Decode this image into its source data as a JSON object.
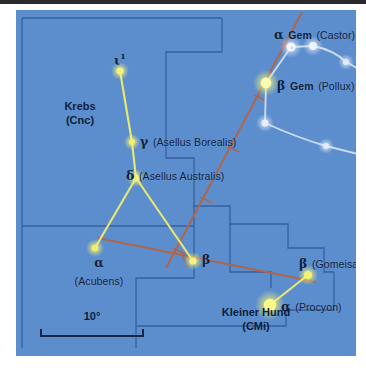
{
  "figure": {
    "type": "star-chart",
    "background_color": "#5c8ece",
    "star_color": "#f2f06a",
    "bright_star_color": "#fbfb8a",
    "constellation_line_color": "#e8e86e",
    "gemini_line_color": "#d8e4f2",
    "ecliptic_color": "#b0654a",
    "boundary_color": "#2f5a96",
    "label_color": "#10213f"
  },
  "scale": {
    "label": "10°",
    "degrees": 10
  },
  "constellations": [
    {
      "id": "cancer",
      "name_line1": "Krebs",
      "name_line2": "(Cnc)",
      "x": 62,
      "y": 96
    },
    {
      "id": "canis-minor",
      "name_line1": "Kleiner Hund",
      "name_line2": "(CMi)",
      "x": 239,
      "y": 302
    }
  ],
  "stars": [
    {
      "id": "iota1-cnc",
      "greek": "ι",
      "superscript": "1",
      "bayer_suffix": "",
      "proper_name": "",
      "x": 104,
      "y": 61,
      "radius": 3.6,
      "label_x": 98,
      "label_y": 41
    },
    {
      "id": "gamma-cnc",
      "greek": "γ",
      "superscript": "",
      "bayer_suffix": "",
      "proper_name": "(Asellus Borealis)",
      "x": 116,
      "y": 132,
      "radius": 3.0,
      "label_x": 124,
      "label_y": 122
    },
    {
      "id": "delta-cnc",
      "greek": "δ",
      "superscript": "",
      "bayer_suffix": "",
      "proper_name": "(Asellus Australis)",
      "x": 120,
      "y": 168,
      "radius": 3.6,
      "label_x": 110,
      "label_y": 156
    },
    {
      "id": "alpha-cnc",
      "greek": "α",
      "superscript": "",
      "bayer_suffix": "",
      "proper_name": "(Acubens)",
      "x": 79,
      "y": 238,
      "radius": 3.3,
      "label_x": 46,
      "label_y": 243
    },
    {
      "id": "beta-cnc",
      "greek": "β",
      "superscript": "",
      "bayer_suffix": "",
      "proper_name": "",
      "x": 177,
      "y": 251,
      "radius": 3.6,
      "label_x": 186,
      "label_y": 241
    },
    {
      "id": "alpha-gem",
      "greek": "α",
      "superscript": "",
      "bayer_suffix": "Gem",
      "proper_name": "(Castor)",
      "x": 275,
      "y": 37,
      "radius": 4.6,
      "label_x": 258,
      "label_y": 16
    },
    {
      "id": "beta-gem",
      "greek": "β",
      "superscript": "",
      "bayer_suffix": "Gem",
      "proper_name": "(Pollux)",
      "x": 250,
      "y": 73,
      "radius": 5.4,
      "label_x": 261,
      "label_y": 67
    },
    {
      "id": "beta-cmi",
      "greek": "β",
      "superscript": "",
      "bayer_suffix": "",
      "proper_name": "(Gomeisa)",
      "x": 292,
      "y": 265,
      "radius": 4.0,
      "label_x": 283,
      "label_y": 245
    },
    {
      "id": "alpha-cmi",
      "greek": "α",
      "superscript": "",
      "bayer_suffix": "",
      "proper_name": "(Procyon)",
      "x": 254,
      "y": 295,
      "radius": 6.2,
      "label_x": 264,
      "label_y": 288
    }
  ],
  "gemini_stars": [
    {
      "id": "gem-a",
      "x": 297,
      "y": 36,
      "radius": 4.0
    },
    {
      "id": "gem-b",
      "x": 330,
      "y": 52,
      "radius": 3.0
    },
    {
      "id": "gem-c",
      "x": 355,
      "y": 69,
      "radius": 2.6
    },
    {
      "id": "gem-d",
      "x": 249,
      "y": 113,
      "radius": 3.4
    },
    {
      "id": "gem-e",
      "x": 310,
      "y": 136,
      "radius": 3.0
    },
    {
      "id": "gem-f",
      "x": 350,
      "y": 146,
      "radius": 4.4
    }
  ],
  "lines": {
    "cancer": [
      {
        "from": "iota1-cnc",
        "to": "gamma-cnc"
      },
      {
        "from": "gamma-cnc",
        "to": "delta-cnc"
      },
      {
        "from": "delta-cnc",
        "to": "alpha-cnc"
      },
      {
        "from": "delta-cnc",
        "to": "beta-cnc"
      }
    ],
    "canis_minor": [
      {
        "from": "alpha-cmi",
        "to": "beta-cmi"
      }
    ],
    "gemini": [
      {
        "from": "alpha-gem",
        "to": "beta-gem"
      },
      {
        "from": "alpha-gem",
        "to": "gem-a"
      },
      {
        "from": "gem-a",
        "to": "gem-b"
      },
      {
        "from": "gem-b",
        "to": "gem-c"
      },
      {
        "from": "beta-gem",
        "to": "gem-d"
      },
      {
        "from": "gem-d",
        "to": "gem-e"
      },
      {
        "from": "gem-e",
        "to": "gem-f"
      }
    ]
  },
  "ecliptic": {
    "label": "ecliptic",
    "tick_count": 6
  }
}
